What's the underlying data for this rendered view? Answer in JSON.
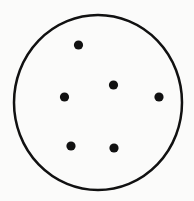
{
  "figure": {
    "width": 194,
    "height": 201,
    "background": "#fbfbfa",
    "boundary": {
      "shape": "ellipse",
      "cx": 98,
      "cy": 102.5,
      "rx": 84,
      "ry": 87.5,
      "stroke": "#111111",
      "stroke_width": 2.5,
      "fill": "none"
    },
    "dot_color": "#111111",
    "dot_radius": 4.6,
    "dots": [
      {
        "id": "dot-1",
        "x": 78.5,
        "y": 45
      },
      {
        "id": "dot-2",
        "x": 113.5,
        "y": 85
      },
      {
        "id": "dot-3",
        "x": 64.5,
        "y": 97
      },
      {
        "id": "dot-4",
        "x": 159,
        "y": 97
      },
      {
        "id": "dot-5",
        "x": 71,
        "y": 146
      },
      {
        "id": "dot-6",
        "x": 114,
        "y": 148
      }
    ]
  }
}
